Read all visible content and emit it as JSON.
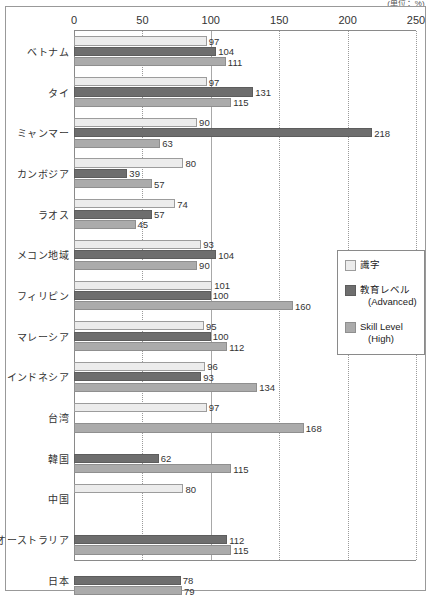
{
  "unit_label": "(単位：%)",
  "chart_data": {
    "type": "bar",
    "orientation": "horizontal",
    "title": "",
    "subtitle": "",
    "xlabel": "",
    "ylabel": "",
    "unit": "(単位：%)",
    "xlim": [
      0,
      250
    ],
    "xticks": [
      0,
      50,
      100,
      150,
      200,
      250
    ],
    "grid": true,
    "gridlines_dotted": [
      50,
      150,
      200
    ],
    "gridlines_solid": [
      100
    ],
    "legend_position": "middle-right",
    "categories": [
      "ベトナム",
      "タイ",
      "ミャンマー",
      "カンボジア",
      "ラオス",
      "メコン地域",
      "フィリピン",
      "マレーシア",
      "インドネシア",
      "台湾",
      "韓国",
      "中国",
      "オーストラリア",
      "日本"
    ],
    "series": [
      {
        "name": "識字",
        "color": "#ececec",
        "values": [
          97,
          97,
          90,
          80,
          74,
          93,
          101,
          95,
          96,
          97,
          null,
          80,
          null,
          null
        ]
      },
      {
        "name": "教育レベル (Advanced)",
        "color": "#6e6e6e",
        "values": [
          104,
          131,
          218,
          39,
          57,
          104,
          100,
          100,
          93,
          null,
          62,
          null,
          112,
          78
        ]
      },
      {
        "name": "Skill Level (High)",
        "color": "#ababab",
        "values": [
          111,
          115,
          63,
          57,
          45,
          90,
          160,
          112,
          134,
          168,
          115,
          null,
          115,
          79
        ]
      }
    ]
  },
  "legend": {
    "items": [
      {
        "label": "識字",
        "sub": "",
        "swatch": "s0"
      },
      {
        "label": "教育レベル",
        "sub": "(Advanced)",
        "swatch": "s1"
      },
      {
        "label": "Skill Level",
        "sub": "(High)",
        "swatch": "s2"
      }
    ]
  }
}
